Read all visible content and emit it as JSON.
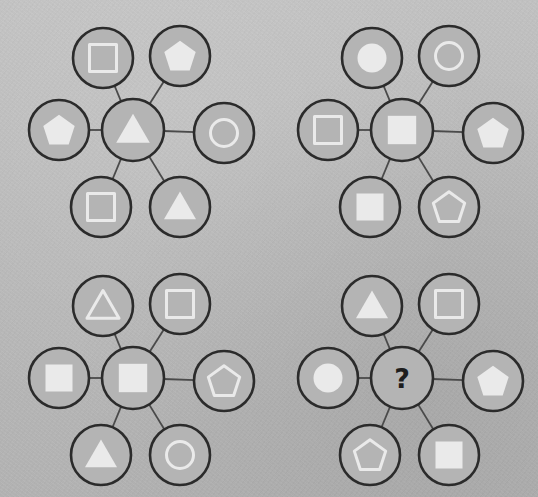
{
  "canvas": {
    "width": 538,
    "height": 497,
    "background_color": "#bcbcbc",
    "description": "Four analogy puzzle panels of hub-and-spoke shape graphs on a textured gray background"
  },
  "style": {
    "node_fill": "#b4b4b4",
    "node_stroke": "#2b2b2b",
    "shape_light": "#eaeaea",
    "edge_color": "#4a4a4a",
    "question_color": "#1d1d1d"
  },
  "legend": {
    "shapes": [
      "square",
      "pentagon",
      "circle",
      "triangle"
    ],
    "fills": [
      "filled",
      "outlined"
    ],
    "unknown_marker": "?"
  },
  "panels": [
    {
      "id": "panel-top-left",
      "name": "Panel A",
      "origin": {
        "x": 0,
        "y": 0
      },
      "center": {
        "shape": "triangle",
        "fill": "filled",
        "label": ""
      },
      "nodes": [
        {
          "position": "top-left",
          "shape": "square",
          "fill": "outlined"
        },
        {
          "position": "top-right",
          "shape": "pentagon",
          "fill": "filled"
        },
        {
          "position": "left",
          "shape": "pentagon",
          "fill": "filled"
        },
        {
          "position": "right",
          "shape": "circle",
          "fill": "outlined"
        },
        {
          "position": "bottom-left",
          "shape": "square",
          "fill": "outlined"
        },
        {
          "position": "bottom-right",
          "shape": "triangle",
          "fill": "filled"
        }
      ]
    },
    {
      "id": "panel-top-right",
      "name": "Panel B",
      "origin": {
        "x": 269,
        "y": 0
      },
      "center": {
        "shape": "square",
        "fill": "filled",
        "label": ""
      },
      "nodes": [
        {
          "position": "top-left",
          "shape": "circle",
          "fill": "filled"
        },
        {
          "position": "top-right",
          "shape": "circle",
          "fill": "outlined"
        },
        {
          "position": "left",
          "shape": "square",
          "fill": "outlined"
        },
        {
          "position": "right",
          "shape": "pentagon",
          "fill": "filled"
        },
        {
          "position": "bottom-left",
          "shape": "square",
          "fill": "filled"
        },
        {
          "position": "bottom-right",
          "shape": "pentagon",
          "fill": "outlined"
        }
      ]
    },
    {
      "id": "panel-bottom-left",
      "name": "Panel C",
      "origin": {
        "x": 0,
        "y": 248
      },
      "center": {
        "shape": "square",
        "fill": "filled",
        "label": ""
      },
      "nodes": [
        {
          "position": "top-left",
          "shape": "triangle",
          "fill": "outlined"
        },
        {
          "position": "top-right",
          "shape": "square",
          "fill": "outlined"
        },
        {
          "position": "left",
          "shape": "square",
          "fill": "filled"
        },
        {
          "position": "right",
          "shape": "pentagon",
          "fill": "outlined"
        },
        {
          "position": "bottom-left",
          "shape": "triangle",
          "fill": "filled"
        },
        {
          "position": "bottom-right",
          "shape": "circle",
          "fill": "outlined"
        }
      ]
    },
    {
      "id": "panel-bottom-right",
      "name": "Panel D",
      "origin": {
        "x": 269,
        "y": 248
      },
      "center": {
        "shape": "unknown",
        "fill": "none",
        "label": "?"
      },
      "nodes": [
        {
          "position": "top-left",
          "shape": "triangle",
          "fill": "filled"
        },
        {
          "position": "top-right",
          "shape": "square",
          "fill": "outlined"
        },
        {
          "position": "left",
          "shape": "circle",
          "fill": "filled"
        },
        {
          "position": "right",
          "shape": "pentagon",
          "fill": "filled"
        },
        {
          "position": "bottom-left",
          "shape": "pentagon",
          "fill": "outlined"
        },
        {
          "position": "bottom-right",
          "shape": "square",
          "fill": "filled"
        }
      ]
    }
  ]
}
